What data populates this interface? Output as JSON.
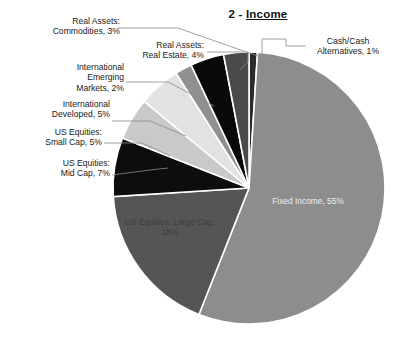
{
  "title": {
    "prefix": "2 - ",
    "underlined": "Income",
    "full": "2 - Income"
  },
  "chart_data": {
    "type": "pie",
    "title": "2 - Income",
    "xlabel": "",
    "ylabel": "",
    "unit": "%",
    "start_angle_deg": 0,
    "direction": "clockwise",
    "legend": "none (direct labels with leader lines)",
    "grid": false,
    "categories": [
      "Cash/Cash Alternatives",
      "Fixed Income",
      "US Equities: Large Cap",
      "US Equities: Mid Cap",
      "US Equities: Small Cap",
      "International Developed",
      "International Emerging Markets",
      "Real Assets: Real Estate",
      "Real Assets: Commodities"
    ],
    "values": [
      1,
      55,
      18,
      7,
      5,
      5,
      2,
      4,
      3
    ],
    "colors": [
      "#2b2b2b",
      "#8d8d8d",
      "#555555",
      "#0d0d0d",
      "#c9c9c9",
      "#e2e2e2",
      "#909090",
      "#0a0a0a",
      "#4a4a4a"
    ],
    "total": 100
  },
  "slices": [
    {
      "name": "Cash/Cash Alternatives",
      "value": 1,
      "color": "#2b2b2b"
    },
    {
      "name": "Fixed Income",
      "value": 55,
      "color": "#8d8d8d"
    },
    {
      "name": "US Equities: Large Cap",
      "value": 18,
      "color": "#555555"
    },
    {
      "name": "US Equities: Mid Cap",
      "value": 7,
      "color": "#0d0d0d"
    },
    {
      "name": "US Equities: Small Cap",
      "value": 5,
      "color": "#c9c9c9"
    },
    {
      "name": "International Developed",
      "value": 5,
      "color": "#e2e2e2"
    },
    {
      "name": "International Emerging Markets",
      "value": 2,
      "color": "#909090"
    },
    {
      "name": "Real Assets: Real Estate",
      "value": 4,
      "color": "#0a0a0a"
    },
    {
      "name": "Real Assets: Commodities",
      "value": 3,
      "color": "#4a4a4a"
    }
  ],
  "labels": {
    "commodities": "Real Assets:\nCommodities, 3%",
    "real_estate": "Real Assets:\nReal Estate, 4%",
    "emerging": "International\nEmerging\nMarkets, 2%",
    "developed": "International\nDeveloped, 5%",
    "small_cap": "US Equities:\nSmall Cap, 5%",
    "mid_cap": "US Equities:\nMid Cap, 7%",
    "cash": "Cash/Cash\nAlternatives, 1%",
    "fixed_income": "Fixed Income, 55%",
    "large_cap": "US Equities: Large Cap,\n18%"
  }
}
